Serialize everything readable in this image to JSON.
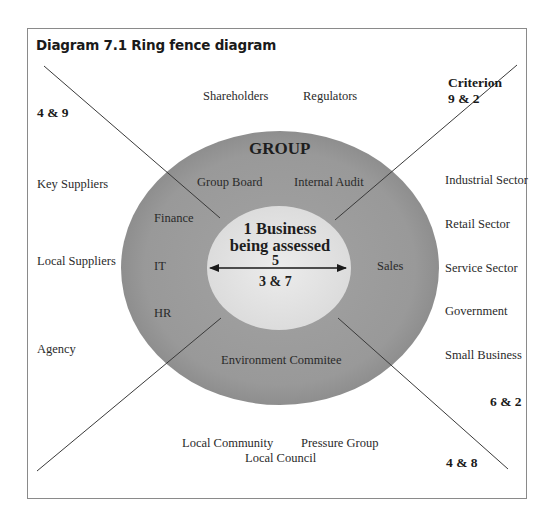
{
  "title": "Diagram 7.1 Ring fence diagram",
  "colors": {
    "outer_ring": "#9a9a9a",
    "inner_circle": "#e4e4e4",
    "lines": "#3a3a3a",
    "frame": "#8a8a8a"
  },
  "criteria": {
    "header": "Criterion",
    "top_right": "9 & 2",
    "top_left": "4 & 9",
    "right": "6 & 2",
    "bottom_right": "4 & 8"
  },
  "top_stakeholders": [
    "Shareholders",
    "Regulators"
  ],
  "left_stakeholders": [
    "Key Suppliers",
    "Local Suppliers",
    "Agency"
  ],
  "right_stakeholders": [
    "Industrial Sector",
    "Retail Sector",
    "Service Sector",
    "Government",
    "Small Business"
  ],
  "bottom_stakeholders": [
    "Local Community",
    "Pressure Group",
    "Local Council"
  ],
  "group": {
    "title": "GROUP",
    "units": {
      "group_board": "Group Board",
      "internal_audit": "Internal Audit",
      "finance": "Finance",
      "it": "IT",
      "hr": "HR",
      "sales": "Sales",
      "environment": "Environment Commitee"
    }
  },
  "business": {
    "line1": "1 Business",
    "line2": "being assessed",
    "criterion_above_arrow": "5",
    "criterion_below_arrow": "3 & 7"
  }
}
